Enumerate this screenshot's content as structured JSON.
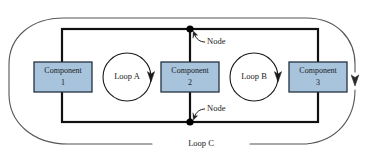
{
  "diagram": {
    "canvas": {
      "width": 376,
      "height": 163,
      "background": "#ffffff"
    },
    "colors": {
      "component_fill": "#a8c4dd",
      "component_stroke": "#24323f",
      "wire": "#111111",
      "outer_loop_stroke": "#55555a",
      "node_dot": "#000000",
      "text": "#1a1a1a"
    },
    "components": [
      {
        "id": "component-1",
        "label_line1": "Component",
        "label_line2": "1",
        "cx": 63,
        "cy": 77,
        "w": 58,
        "h": 30
      },
      {
        "id": "component-2",
        "label_line1": "Component",
        "label_line2": "2",
        "cx": 190,
        "cy": 77,
        "w": 58,
        "h": 30
      },
      {
        "id": "component-3",
        "label_line1": "Component",
        "label_line2": "3",
        "cx": 318,
        "cy": 77,
        "w": 58,
        "h": 30
      }
    ],
    "loops": [
      {
        "id": "loop-a",
        "label": "Loop A",
        "cx": 127,
        "cy": 77,
        "r": 24
      },
      {
        "id": "loop-b",
        "label": "Loop B",
        "cx": 254,
        "cy": 77,
        "r": 24
      },
      {
        "id": "loop-c",
        "label": "Loop C"
      }
    ],
    "nodes": [
      {
        "id": "node-top",
        "label": "Node",
        "x": 190,
        "y": 29,
        "label_x": 206,
        "label_y": 42
      },
      {
        "id": "node-bottom",
        "label": "Node",
        "x": 190,
        "y": 122,
        "label_x": 206,
        "label_y": 110
      }
    ],
    "inner_rect": {
      "x": 62,
      "y": 29,
      "w": 256,
      "h": 93
    }
  }
}
